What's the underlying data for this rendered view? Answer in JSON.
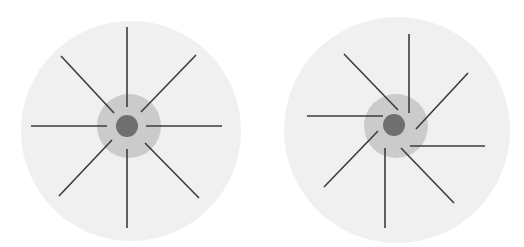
{
  "canvas": {
    "width": 524,
    "height": 247,
    "background": "#ffffff"
  },
  "colors": {
    "outer_disk": "#f0f0f0",
    "inner_disk": "#cbcbcb",
    "center_dot": "#6f6f6f",
    "spoke": "#3c3c3c"
  },
  "figures": [
    {
      "name": "symmetric-radial-figure",
      "outer_disk": {
        "cx": 131,
        "cy": 131,
        "r": 110
      },
      "inner_disk": {
        "cx": 129,
        "cy": 126,
        "r": 32
      },
      "center_dot": {
        "cx": 127,
        "cy": 126,
        "r": 11
      },
      "spoke_width": 1.6,
      "spokes": [
        {
          "x1": 127,
          "y1": 27,
          "x2": 127,
          "y2": 107
        },
        {
          "x1": 196,
          "y1": 55,
          "x2": 141,
          "y2": 112
        },
        {
          "x1": 222,
          "y1": 126,
          "x2": 146,
          "y2": 126
        },
        {
          "x1": 199,
          "y1": 198,
          "x2": 145,
          "y2": 143
        },
        {
          "x1": 127,
          "y1": 228,
          "x2": 127,
          "y2": 149
        },
        {
          "x1": 59,
          "y1": 196,
          "x2": 112,
          "y2": 140
        },
        {
          "x1": 31,
          "y1": 126,
          "x2": 107,
          "y2": 126
        },
        {
          "x1": 61,
          "y1": 56,
          "x2": 114,
          "y2": 113
        }
      ]
    },
    {
      "name": "offset-pinwheel-figure",
      "outer_disk": {
        "cx": 397,
        "cy": 130,
        "r": 113
      },
      "inner_disk": {
        "cx": 396,
        "cy": 126,
        "r": 32
      },
      "center_dot": {
        "cx": 394,
        "cy": 125,
        "r": 11
      },
      "spoke_width": 1.6,
      "spokes": [
        {
          "x1": 409,
          "y1": 34,
          "x2": 409,
          "y2": 113
        },
        {
          "x1": 468,
          "y1": 73,
          "x2": 416,
          "y2": 129
        },
        {
          "x1": 485,
          "y1": 146,
          "x2": 410,
          "y2": 146
        },
        {
          "x1": 454,
          "y1": 203,
          "x2": 401,
          "y2": 148
        },
        {
          "x1": 385,
          "y1": 228,
          "x2": 385,
          "y2": 148
        },
        {
          "x1": 324,
          "y1": 187,
          "x2": 378,
          "y2": 131
        },
        {
          "x1": 307,
          "y1": 116,
          "x2": 383,
          "y2": 116
        },
        {
          "x1": 344,
          "y1": 54,
          "x2": 398,
          "y2": 110
        }
      ]
    }
  ]
}
